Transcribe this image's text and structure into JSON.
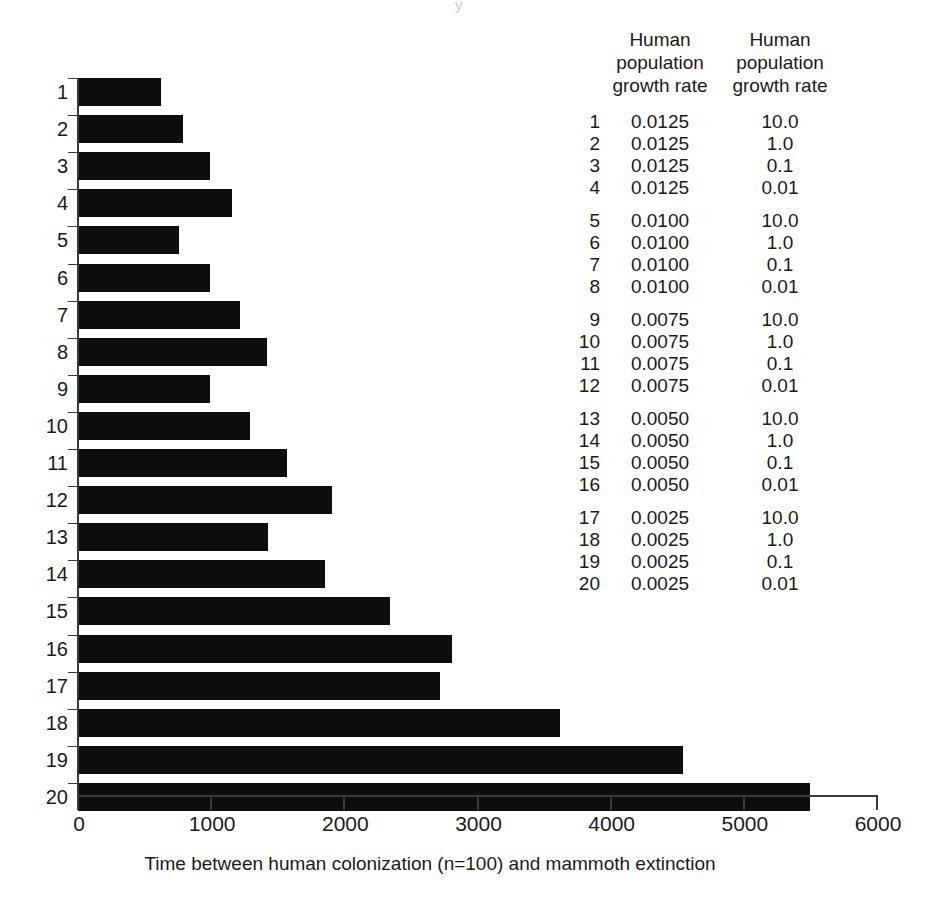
{
  "chart_data": {
    "type": "bar",
    "orientation": "horizontal",
    "title": "",
    "xlabel": "Time between human colonization (n=100) and mammoth extinction",
    "ylabel": "",
    "xlim": [
      0,
      6000
    ],
    "xticks": [
      0,
      1000,
      2000,
      3000,
      4000,
      5000,
      6000
    ],
    "xtick_labels": [
      "0",
      "1000",
      "2000",
      "3000",
      "4000",
      "5000",
      "6000"
    ],
    "grid": false,
    "legend": "none",
    "bar_color": "#0d0d0d",
    "categories": [
      "1",
      "2",
      "3",
      "4",
      "5",
      "6",
      "7",
      "8",
      "9",
      "10",
      "11",
      "12",
      "13",
      "14",
      "15",
      "16",
      "17",
      "18",
      "19",
      "20"
    ],
    "values": [
      620,
      790,
      990,
      1155,
      760,
      990,
      1215,
      1420,
      990,
      1290,
      1570,
      1905,
      1425,
      1855,
      2340,
      2805,
      2715,
      3620,
      4540,
      5495
    ]
  },
  "side_table": {
    "headers": [
      "Human population growth rate",
      "Human population growth rate"
    ],
    "header_lines": [
      [
        "Human",
        "population",
        "growth rate"
      ],
      [
        "Human",
        "population",
        "growth rate"
      ]
    ],
    "rows": [
      {
        "index": "1",
        "rate": "0.0125",
        "density": "10.0",
        "group": 1
      },
      {
        "index": "2",
        "rate": "0.0125",
        "density": "1.0",
        "group": 1
      },
      {
        "index": "3",
        "rate": "0.0125",
        "density": "0.1",
        "group": 1
      },
      {
        "index": "4",
        "rate": "0.0125",
        "density": "0.01",
        "group": 1
      },
      {
        "index": "5",
        "rate": "0.0100",
        "density": "10.0",
        "group": 2
      },
      {
        "index": "6",
        "rate": "0.0100",
        "density": "1.0",
        "group": 2
      },
      {
        "index": "7",
        "rate": "0.0100",
        "density": "0.1",
        "group": 2
      },
      {
        "index": "8",
        "rate": "0.0100",
        "density": "0.01",
        "group": 2
      },
      {
        "index": "9",
        "rate": "0.0075",
        "density": "10.0",
        "group": 3
      },
      {
        "index": "10",
        "rate": "0.0075",
        "density": "1.0",
        "group": 3
      },
      {
        "index": "11",
        "rate": "0.0075",
        "density": "0.1",
        "group": 3
      },
      {
        "index": "12",
        "rate": "0.0075",
        "density": "0.01",
        "group": 3
      },
      {
        "index": "13",
        "rate": "0.0050",
        "density": "10.0",
        "group": 4
      },
      {
        "index": "14",
        "rate": "0.0050",
        "density": "1.0",
        "group": 4
      },
      {
        "index": "15",
        "rate": "0.0050",
        "density": "0.1",
        "group": 4
      },
      {
        "index": "16",
        "rate": "0.0050",
        "density": "0.01",
        "group": 4
      },
      {
        "index": "17",
        "rate": "0.0025",
        "density": "10.0",
        "group": 5
      },
      {
        "index": "18",
        "rate": "0.0025",
        "density": "1.0",
        "group": 5
      },
      {
        "index": "19",
        "rate": "0.0025",
        "density": "0.1",
        "group": 5
      },
      {
        "index": "20",
        "rate": "0.0025",
        "density": "0.01",
        "group": 5
      }
    ]
  },
  "artifact": {
    "mark": "y"
  }
}
